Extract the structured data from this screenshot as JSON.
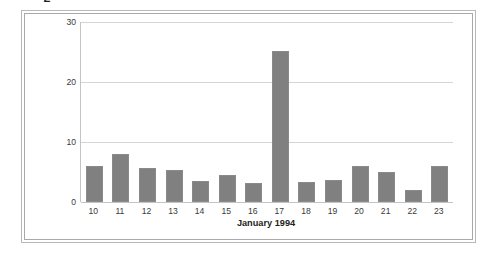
{
  "chart_data": {
    "type": "bar",
    "title": "",
    "xlabel": "January 1994",
    "ylabel": "Number of Cardiac Deaths",
    "categories": [
      "10",
      "11",
      "12",
      "13",
      "14",
      "15",
      "16",
      "17",
      "18",
      "19",
      "20",
      "21",
      "22",
      "23"
    ],
    "values": [
      6,
      8,
      5.7,
      5.4,
      3.5,
      4.5,
      3.1,
      25.2,
      3.4,
      3.7,
      6,
      5,
      2,
      6
    ],
    "ylim": [
      0,
      30
    ],
    "yticks": [
      0,
      10,
      20,
      30
    ],
    "ytick_labels": [
      "0",
      "10",
      "20",
      "30"
    ],
    "grid": "horizontal",
    "legend": "none",
    "bar_color": "#808080",
    "bar_edge_color": "#8a8a8a",
    "gridline_color": "#d4d4d4",
    "axis_color": "#c4c4c4",
    "text_color": "#231f20",
    "tick_text_color": "#3a3a3a",
    "background_color": "#ffffff",
    "frame_color": "#b8b8b8"
  }
}
